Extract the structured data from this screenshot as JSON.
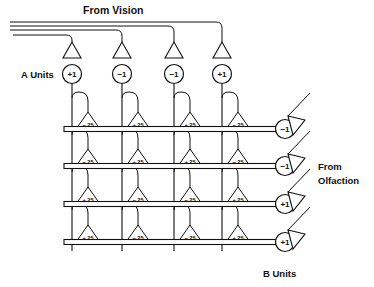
{
  "figure": {
    "labels": {
      "from_vision": "From Vision",
      "a_units": "A Units",
      "from_olfaction_line1": "From",
      "from_olfaction_line2": "Olfaction",
      "b_units": "B Units"
    },
    "a_units": [
      {
        "value": "+1"
      },
      {
        "value": "−1"
      },
      {
        "value": "−1"
      },
      {
        "value": "+1"
      }
    ],
    "b_units": [
      {
        "value": "−1"
      },
      {
        "value": "−1"
      },
      {
        "value": "+1"
      },
      {
        "value": "+1"
      }
    ],
    "weight_matrix": {
      "rows": [
        {
          "weights": [
            "−.25",
            "+.25",
            "+.25",
            "−.25"
          ]
        },
        {
          "weights": [
            "−.25",
            "+.25",
            "+.25",
            "−.25"
          ]
        },
        {
          "weights": [
            "+.25",
            "−.25",
            "−.25",
            "+.25"
          ]
        },
        {
          "weights": [
            "+.25",
            "−.25",
            "−.25",
            "+.25"
          ]
        }
      ]
    },
    "colors": {
      "ink": "#111111",
      "paper": "#ffffff"
    }
  }
}
